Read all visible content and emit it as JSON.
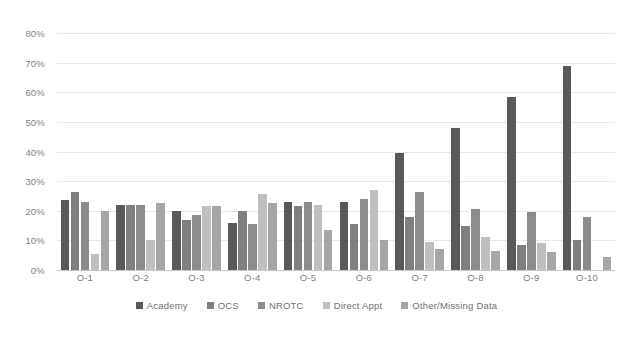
{
  "chart_data": {
    "type": "bar",
    "title": "",
    "subtitle": "",
    "xlabel": "",
    "ylabel": "",
    "grid": true,
    "legend_position": "bottom",
    "ylim": [
      0,
      0.8
    ],
    "y_ticks": [
      "0%",
      "10%",
      "20%",
      "30%",
      "40%",
      "50%",
      "60%",
      "70%",
      "80%"
    ],
    "y_tick_values": [
      0,
      10,
      20,
      30,
      40,
      50,
      60,
      70,
      80
    ],
    "categories": [
      "O-1",
      "O-2",
      "O-3",
      "O-4",
      "O-5",
      "O-6",
      "O-7",
      "O-8",
      "O-9",
      "O-10"
    ],
    "series": [
      {
        "name": "Academy",
        "color": "#595959",
        "values": [
          23.5,
          22.0,
          20.0,
          16.0,
          23.0,
          23.0,
          39.5,
          48.0,
          58.5,
          69.0
        ]
      },
      {
        "name": "OCS",
        "color": "#7f7f7f",
        "values": [
          26.5,
          22.0,
          17.0,
          20.0,
          21.5,
          15.5,
          18.0,
          15.0,
          8.5,
          10.0
        ]
      },
      {
        "name": "NROTC",
        "color": "#8c8c8c",
        "values": [
          23.0,
          22.0,
          18.5,
          15.5,
          23.0,
          24.0,
          26.5,
          20.5,
          19.5,
          18.0
        ]
      },
      {
        "name": "Direct Appt",
        "color": "#bfbfbf",
        "values": [
          5.5,
          10.0,
          21.5,
          25.5,
          22.0,
          27.0,
          9.5,
          11.0,
          9.0,
          0.0
        ]
      },
      {
        "name": "Other/Missing Data",
        "color": "#a6a6a6",
        "values": [
          20.0,
          22.5,
          21.5,
          22.5,
          13.5,
          10.0,
          7.0,
          6.5,
          6.0,
          4.5
        ]
      }
    ]
  },
  "legend": {
    "items": [
      {
        "label": "Academy",
        "color": "#595959"
      },
      {
        "label": "OCS",
        "color": "#7f7f7f"
      },
      {
        "label": "NROTC",
        "color": "#8c8c8c"
      },
      {
        "label": "Direct Appt",
        "color": "#bfbfbf"
      },
      {
        "label": "Other/Missing Data",
        "color": "#a6a6a6"
      }
    ]
  }
}
